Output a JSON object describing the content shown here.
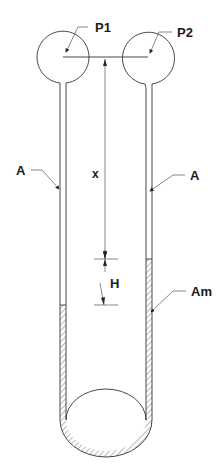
{
  "diagram": {
    "type": "U-tube manometer",
    "labels": {
      "p1": "P1",
      "p2": "P2",
      "a_left": "A",
      "a_right": "A",
      "x": "x",
      "h": "H",
      "am": "Am"
    },
    "colors": {
      "line": "#333333",
      "hatch": "#666666",
      "background": "#ffffff"
    }
  }
}
